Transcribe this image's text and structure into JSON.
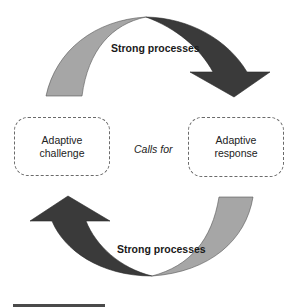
{
  "diagram": {
    "top_arrow": {
      "label": "Strong processes",
      "direction": "left-to-right, clockwise over top",
      "tail_color": "#a6a6a6",
      "head_color": "#3a3a3a"
    },
    "bottom_arrow": {
      "label": "Strong processes",
      "direction": "right-to-left, clockwise under bottom",
      "tail_color": "#a6a6a6",
      "head_color": "#3a3a3a"
    },
    "left_box": {
      "line1": "Adaptive",
      "line2": "challenge"
    },
    "right_box": {
      "line1": "Adaptive",
      "line2": "response"
    },
    "connector_label": "Calls for"
  },
  "colors": {
    "light_band": "#a6a6a6",
    "dark_band": "#3a3a3a",
    "outline": "#555555",
    "box_border": "#6a6a6a"
  }
}
